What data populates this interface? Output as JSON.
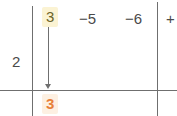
{
  "diagram": {
    "kind": "long-division-grid",
    "background_color": "#ffffff",
    "line_color": "#6f6f6f",
    "text_color": "#4a4a4a",
    "highlight_text_color": "#6b6328",
    "highlight_background_color": "#fbf3d3",
    "orange_text_color": "#e8803a",
    "orange_background_color": "#fdf0e2"
  },
  "labels": {
    "left_multiplier": "2",
    "top_highlighted_term": "3",
    "top_term_2": "−5",
    "top_term_3": "−6",
    "top_term_4": "+",
    "bottom_result": "3"
  },
  "marks": {
    "arrow_name": "downward-arrow",
    "arrow_from_label": "3",
    "arrow_to_label": "3"
  }
}
